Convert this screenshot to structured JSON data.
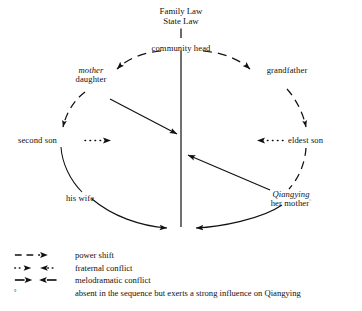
{
  "figure": {
    "title_lines": [
      "Family Law",
      "State Law"
    ],
    "center_node": "community head"
  },
  "nodes": [
    {
      "id": "mother-daughter",
      "italic": "mother",
      "normal": "daughter"
    },
    {
      "id": "grandfather",
      "italic": "",
      "normal": "grandfather"
    },
    {
      "id": "second-son",
      "italic": "",
      "normal": "second son"
    },
    {
      "id": "eldest-son",
      "italic": "",
      "normal": "eldest son"
    },
    {
      "id": "his-wife",
      "italic": "",
      "normal": "his wife"
    },
    {
      "id": "qiangying-her-mother",
      "italic": "Qiangying",
      "normal": "her mother"
    }
  ],
  "labels": {
    "title_line_1": "Family Law",
    "title_line_2": "State Law",
    "community_head": "community head",
    "mother": "mother",
    "daughter": "daughter",
    "grandfather": "grandfather",
    "second_son": "second son",
    "eldest_son": "eldest son",
    "his_wife": "his wife",
    "qiangying": "Qiangying",
    "her_mother": "her mother",
    "her_mother_marker": "°"
  },
  "legend": {
    "items": [
      {
        "symbol": "dashed-arrow-right",
        "label": "power shift"
      },
      {
        "symbol": "dotted-arrow-right-left-pair",
        "label": "fraternal conflict"
      },
      {
        "symbol": "solid-arrow-right-left-pair",
        "label": "melodramatic conflict"
      },
      {
        "symbol": "degree-marker",
        "label": "absent in the sequence but exerts a strong influence on Qiangying"
      }
    ],
    "footnote_marker": "°"
  },
  "colors": {
    "ink": "#111111",
    "background": "#ffffff"
  }
}
